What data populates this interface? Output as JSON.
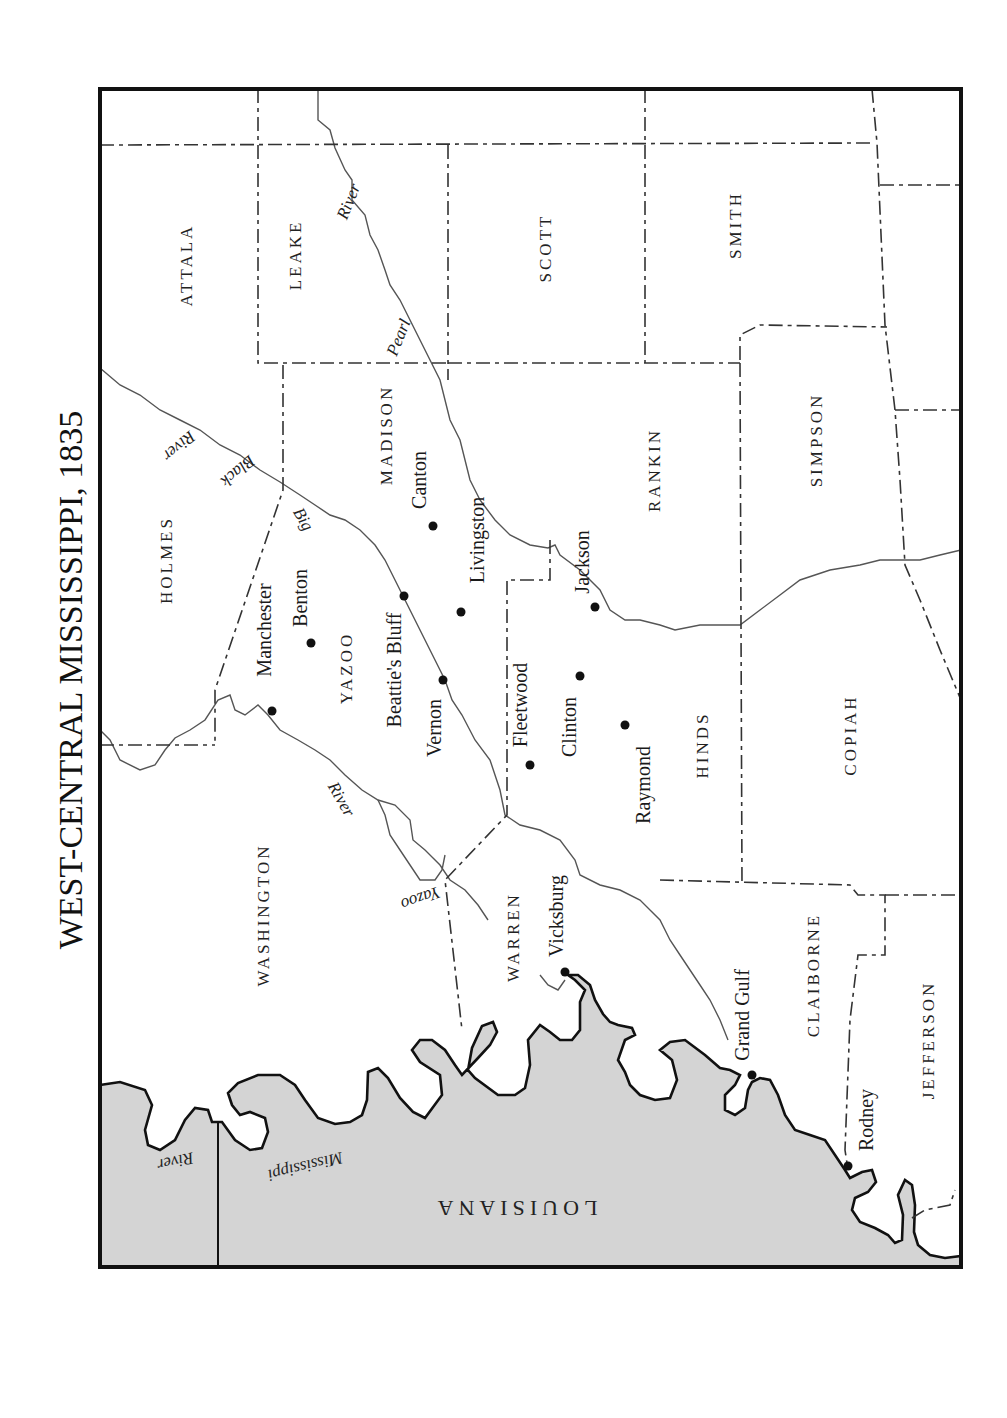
{
  "title": "WEST-CENTRAL MISSISSIPPI, 1835",
  "orientation": "rotated 90° counter-clockwise (north to the right)",
  "colors": {
    "land": "#ffffff",
    "louisiana": "#d4d4d4",
    "frame": "#111111",
    "boundary": "#333333",
    "river": "#555555"
  },
  "counties": [
    {
      "name": "ATTALA",
      "x": 188,
      "y": 265
    },
    {
      "name": "LEAKE",
      "x": 297,
      "y": 255
    },
    {
      "name": "SCOTT",
      "x": 547,
      "y": 248
    },
    {
      "name": "SMITH",
      "x": 737,
      "y": 225
    },
    {
      "name": "HOLMES",
      "x": 168,
      "y": 560
    },
    {
      "name": "MADISON",
      "x": 388,
      "y": 435
    },
    {
      "name": "RANKIN",
      "x": 656,
      "y": 470
    },
    {
      "name": "SIMPSON",
      "x": 818,
      "y": 440
    },
    {
      "name": "YAZOO",
      "x": 348,
      "y": 668
    },
    {
      "name": "HINDS",
      "x": 704,
      "y": 745
    },
    {
      "name": "COPIAH",
      "x": 852,
      "y": 735
    },
    {
      "name": "WASHINGTON",
      "x": 265,
      "y": 915
    },
    {
      "name": "WARREN",
      "x": 515,
      "y": 937
    },
    {
      "name": "CLAIBORNE",
      "x": 815,
      "y": 975
    },
    {
      "name": "JEFFERSON",
      "x": 930,
      "y": 1040
    }
  ],
  "towns": [
    {
      "name": "Canton",
      "dot": [
        433,
        526
      ],
      "label": [
        421,
        480
      ]
    },
    {
      "name": "Livingston",
      "dot": [
        461,
        612
      ],
      "label": [
        479,
        540
      ]
    },
    {
      "name": "Manchester",
      "dot": [
        272,
        711
      ],
      "label": [
        266,
        630
      ]
    },
    {
      "name": "Benton",
      "dot": [
        311,
        643
      ],
      "label": [
        302,
        598
      ]
    },
    {
      "name": "Beattie's Bluff",
      "dot": [
        404,
        596
      ],
      "label": [
        396,
        670
      ]
    },
    {
      "name": "Vernon",
      "dot": [
        443,
        680
      ],
      "label": [
        436,
        728
      ]
    },
    {
      "name": "Fleetwood",
      "dot": [
        530,
        765
      ],
      "label": [
        522,
        705
      ]
    },
    {
      "name": "Clinton",
      "dot": [
        580,
        676
      ],
      "label": [
        571,
        727
      ]
    },
    {
      "name": "Jackson",
      "dot": [
        595,
        607
      ],
      "label": [
        584,
        562
      ]
    },
    {
      "name": "Raymond",
      "dot": [
        625,
        725
      ],
      "label": [
        645,
        785
      ]
    },
    {
      "name": "Vicksburg",
      "dot": [
        565,
        972
      ],
      "label": [
        558,
        916
      ]
    },
    {
      "name": "Grand Gulf",
      "dot": [
        752,
        1075
      ],
      "label": [
        744,
        1015
      ]
    },
    {
      "name": "Rodney",
      "dot": [
        848,
        1166
      ],
      "label": [
        868,
        1120
      ]
    }
  ],
  "rivers": [
    {
      "name": "Pearl River",
      "parts": [
        {
          "text": "Pearl",
          "x": 400,
          "y": 338,
          "rotate": -68
        },
        {
          "text": "River",
          "x": 350,
          "y": 202,
          "rotate": -68
        }
      ]
    },
    {
      "name": "Big Black River",
      "parts": [
        {
          "text": "River",
          "x": 178,
          "y": 445,
          "rotate": 140
        },
        {
          "text": "Black",
          "x": 237,
          "y": 470,
          "rotate": 140
        },
        {
          "text": "Big",
          "x": 302,
          "y": 520,
          "rotate": 60
        }
      ]
    },
    {
      "name": "Yazoo River",
      "parts": [
        {
          "text": "River",
          "x": 340,
          "y": 800,
          "rotate": 60
        },
        {
          "text": "Yazoo",
          "x": 420,
          "y": 897,
          "rotate": 160
        }
      ]
    },
    {
      "name": "Mississippi River",
      "parts": [
        {
          "text": "River",
          "x": 175,
          "y": 1160,
          "rotate": 168
        },
        {
          "text": "Mississippi",
          "x": 305,
          "y": 1165,
          "rotate": 166
        }
      ]
    }
  ],
  "state": {
    "name": "LOUISIANA",
    "x": 515,
    "y": 1206,
    "rotate": 180
  }
}
